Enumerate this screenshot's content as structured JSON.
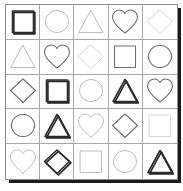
{
  "figure": {
    "type": "latin-square-shape-matrix",
    "rows": 5,
    "columns": 5,
    "background_color": "#ffffff",
    "border_color": "#8b8b8b",
    "cell_divider_color": "#a8a8a8",
    "drop_shadow_color": "#1a1a1a",
    "shape_names": [
      "square",
      "circle",
      "triangle",
      "heart",
      "diamond"
    ],
    "ink_levels": {
      "dark": "#2b2b2b",
      "medium": "#6e6e6e",
      "light": "#b4b4b4",
      "faint": "#cfcfcf"
    }
  },
  "grid": {
    "cells": [
      [
        {
          "shape": "square",
          "ink": "dark",
          "shadow": true
        },
        {
          "shape": "circle",
          "ink": "light",
          "shadow": false
        },
        {
          "shape": "triangle",
          "ink": "light",
          "shadow": false
        },
        {
          "shape": "heart",
          "ink": "medium",
          "shadow": false
        },
        {
          "shape": "diamond",
          "ink": "faint",
          "shadow": false
        }
      ],
      [
        {
          "shape": "triangle",
          "ink": "light",
          "shadow": false
        },
        {
          "shape": "heart",
          "ink": "medium",
          "shadow": false
        },
        {
          "shape": "diamond",
          "ink": "faint",
          "shadow": false
        },
        {
          "shape": "square",
          "ink": "medium",
          "shadow": false
        },
        {
          "shape": "circle",
          "ink": "medium",
          "shadow": false
        }
      ],
      [
        {
          "shape": "diamond",
          "ink": "medium",
          "shadow": false
        },
        {
          "shape": "square",
          "ink": "dark",
          "shadow": true
        },
        {
          "shape": "circle",
          "ink": "light",
          "shadow": false
        },
        {
          "shape": "triangle",
          "ink": "dark",
          "shadow": true
        },
        {
          "shape": "heart",
          "ink": "medium",
          "shadow": false
        }
      ],
      [
        {
          "shape": "circle",
          "ink": "medium",
          "shadow": false
        },
        {
          "shape": "triangle",
          "ink": "dark",
          "shadow": true
        },
        {
          "shape": "heart",
          "ink": "light",
          "shadow": false
        },
        {
          "shape": "diamond",
          "ink": "medium",
          "shadow": false
        },
        {
          "shape": "square",
          "ink": "faint",
          "shadow": false
        }
      ],
      [
        {
          "shape": "heart",
          "ink": "light",
          "shadow": false
        },
        {
          "shape": "diamond",
          "ink": "dark",
          "shadow": true
        },
        {
          "shape": "square",
          "ink": "light",
          "shadow": false
        },
        {
          "shape": "circle",
          "ink": "light",
          "shadow": false
        },
        {
          "shape": "triangle",
          "ink": "dark",
          "shadow": true
        }
      ]
    ]
  }
}
